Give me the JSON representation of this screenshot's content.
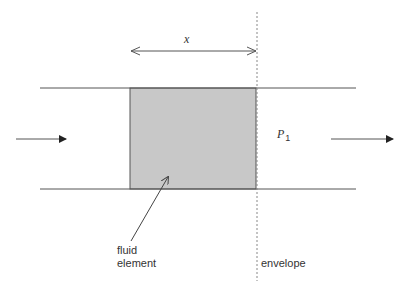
{
  "diagram": {
    "labels": {
      "x": "x",
      "pressure": "P",
      "pressure_subscript": "1",
      "fluid_element_line1": "fluid",
      "fluid_element_line2": "element",
      "envelope": "envelope"
    },
    "colors": {
      "line": "#555555",
      "fluid_fill": "#c8c8c8",
      "dashed": "#888888",
      "text": "#333333"
    },
    "geometry": {
      "pipe_top_y": 88,
      "pipe_bottom_y": 189,
      "pipe_x_start": 40,
      "pipe_x_end": 356,
      "element_x_left": 130,
      "element_x_right": 256,
      "envelope_x": 257
    }
  }
}
